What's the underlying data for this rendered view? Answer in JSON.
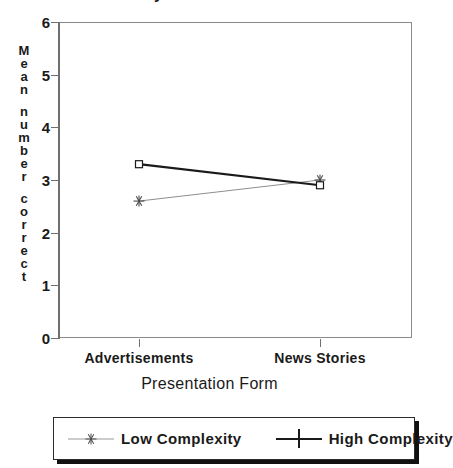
{
  "chart_data": {
    "type": "line",
    "title": "Dynamic Printed",
    "xlabel": "Presentation Form",
    "ylabel": "Mean number correct",
    "categories": [
      "Advertisements",
      "News Stories"
    ],
    "ylim": [
      0,
      6
    ],
    "yticks": [
      0,
      1,
      2,
      3,
      4,
      5,
      6
    ],
    "grid": false,
    "legend_position": "bottom",
    "series": [
      {
        "name": "Low Complexity",
        "values": [
          2.6,
          3.0
        ],
        "marker": "asterisk",
        "line_style": "thin",
        "color": "#4a4a4a"
      },
      {
        "name": "High Complexity",
        "values": [
          3.3,
          2.9
        ],
        "marker": "square",
        "line_style": "thick",
        "color": "#1a1a1a"
      }
    ]
  },
  "axes": {
    "y_tick_labels": [
      "6",
      "5",
      "4",
      "3",
      "2",
      "1",
      "0"
    ],
    "y_title_chars": [
      "M",
      "e",
      "a",
      "n",
      "",
      "n",
      "u",
      "m",
      "b",
      "e",
      "r",
      "",
      "c",
      "o",
      "r",
      "r",
      "e",
      "c",
      "t"
    ]
  },
  "legend": {
    "entries": [
      {
        "label": "Low Complexity",
        "marker": "asterisk-marker"
      },
      {
        "label": "High Complexity",
        "marker": "square-marker"
      }
    ]
  }
}
